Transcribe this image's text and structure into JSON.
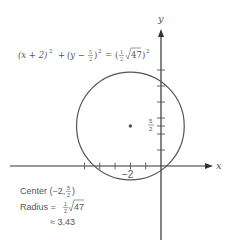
{
  "diagram": {
    "equation": {
      "lhs1": "(x + 2)",
      "exp1": "2",
      "plus": "+",
      "lhs2_pre": "(y −",
      "frac_num": "5",
      "frac_den": "2",
      "lhs2_post": ")",
      "exp2": "2",
      "eq": "=",
      "rhs_pre": "(",
      "rhs_frac_num": "1",
      "rhs_frac_den": "2",
      "rhs_sqrt_arg": "47",
      "rhs_post": ")",
      "exp3": "2"
    },
    "axes": {
      "x_label": "x",
      "y_label": "y",
      "x_tick_label": "−2",
      "y_tick_label_num": "5",
      "y_tick_label_den": "2"
    },
    "circle": {
      "center": [
        -2,
        2.5
      ],
      "radius": 3.43
    },
    "info": {
      "center_label": "Center (−2,",
      "center_num": "5",
      "center_den": "2",
      "center_close": ")",
      "radius_label": "Radius =",
      "radius_num": "1",
      "radius_den": "2",
      "radius_sqrt": "47",
      "approx_label": "≈ 3.43"
    },
    "x_ticks": [
      -5,
      -4,
      -3,
      -2,
      -1
    ],
    "y_ticks": [
      1,
      2,
      2.5,
      3,
      4,
      5,
      6
    ]
  }
}
